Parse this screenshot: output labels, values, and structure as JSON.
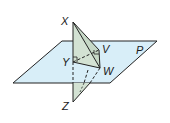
{
  "figure": {
    "plane_label": "P",
    "points": {
      "X": "X",
      "Y": "Y",
      "Z": "Z",
      "V": "V",
      "W": "W"
    },
    "colors": {
      "plane_fill": "#d8eef8",
      "triangle_fill": "#d3e2d3",
      "stroke": "#222222"
    }
  }
}
